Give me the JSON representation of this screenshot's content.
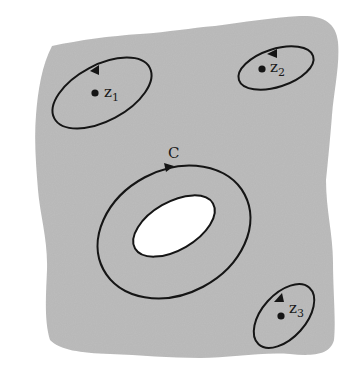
{
  "diagram": {
    "type": "complex-analysis-contours",
    "colors": {
      "region_fill": "#bdbdbd",
      "hole_fill": "#ffffff",
      "stroke": "#151515",
      "background": "#ffffff"
    },
    "region": {
      "description": "gray irregular domain with a white hole"
    },
    "contours": [
      {
        "id": "z1",
        "label": "z",
        "subscript": "1",
        "kind": "small-loop-around-point"
      },
      {
        "id": "z2",
        "label": "z",
        "subscript": "2",
        "kind": "small-loop-around-point"
      },
      {
        "id": "z3",
        "label": "z",
        "subscript": "3",
        "kind": "small-loop-around-point"
      },
      {
        "id": "C",
        "label": "C",
        "kind": "loop-around-hole"
      }
    ]
  }
}
